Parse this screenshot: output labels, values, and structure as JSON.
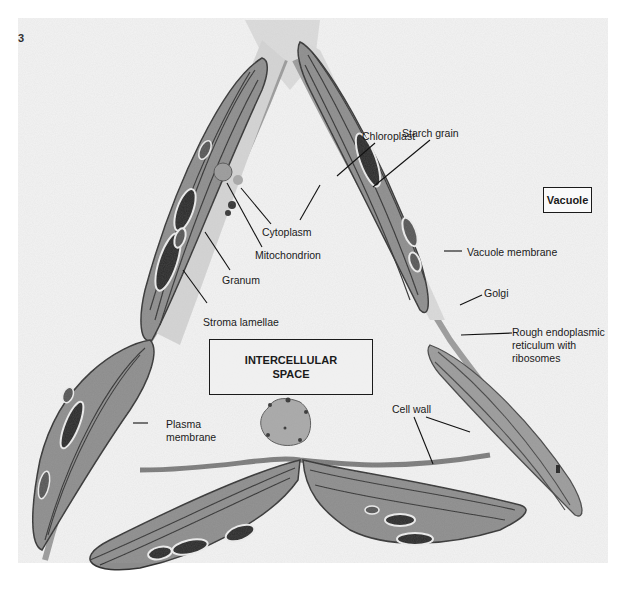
{
  "figure": {
    "number": "3"
  },
  "regions": {
    "vacuole": "Vacuole",
    "intercellular_space": "INTERCELLULAR SPACE"
  },
  "labels": [
    {
      "id": "chloroplast",
      "text": "Chloroplast"
    },
    {
      "id": "starch-grain",
      "text": "Starch grain"
    },
    {
      "id": "cytoplasm",
      "text": "Cytoplasm"
    },
    {
      "id": "mitochondrion",
      "text": "Mitochondrion"
    },
    {
      "id": "granum",
      "text": "Granum"
    },
    {
      "id": "stroma-lamellae",
      "text": "Stroma lamellae"
    },
    {
      "id": "vacuole-membrane",
      "text": "Vacuole membrane"
    },
    {
      "id": "golgi",
      "text": "Golgi"
    },
    {
      "id": "rough-er",
      "text": "Rough endoplasmic reticulum with ribosomes",
      "lines": [
        "Rough endoplasmic",
        "reticulum with",
        "ribosomes"
      ]
    },
    {
      "id": "plasma-membrane",
      "text": "Plasma membrane",
      "lines": [
        "Plasma",
        "membrane"
      ]
    },
    {
      "id": "cell-wall",
      "text": "Cell wall"
    }
  ],
  "colors": {
    "background": "#ffffff",
    "plate": "#f3f3f3",
    "cytoplasm": "#d8d8d8",
    "chloroplast": "#8a8a8a",
    "thylakoid": "#3a3a3a",
    "starch": "#2a2a2a",
    "ink": "#1a1a1a"
  }
}
